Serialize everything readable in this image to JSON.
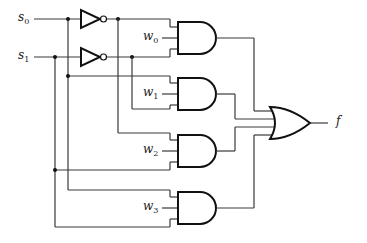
{
  "diagram": {
    "type": "4-to-1 multiplexer logic circuit",
    "inputs": {
      "s0": {
        "base": "s",
        "sub": "0"
      },
      "s1": {
        "base": "s",
        "sub": "1"
      }
    },
    "data_inputs": [
      {
        "base": "w",
        "sub": "0"
      },
      {
        "base": "w",
        "sub": "1"
      },
      {
        "base": "w",
        "sub": "2"
      },
      {
        "base": "w",
        "sub": "3"
      }
    ],
    "output": {
      "label": "f"
    },
    "gates": {
      "not": [
        "NOT s0",
        "NOT s1"
      ],
      "and": [
        "AND w0",
        "AND w1",
        "AND w2",
        "AND w3"
      ],
      "or": [
        "OR f"
      ]
    },
    "colors": {
      "wire": "#3a3a3a",
      "gate_stroke": "#111111",
      "background": "#ffffff"
    }
  }
}
